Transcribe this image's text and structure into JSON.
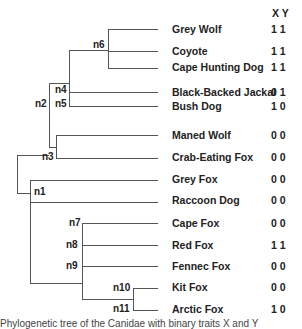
{
  "header": {
    "xy_label": "X Y"
  },
  "leaves": [
    {
      "name": "Grey Wolf",
      "xy": "1 1",
      "y": 23
    },
    {
      "name": "Coyote",
      "xy": "1 1",
      "y": 45
    },
    {
      "name": "Cape Hunting Dog",
      "xy": "1 1",
      "y": 61
    },
    {
      "name": "Black-Backed Jackal",
      "xy": "0 1",
      "y": 86
    },
    {
      "name": "Bush Dog",
      "xy": "1 0",
      "y": 100
    },
    {
      "name": "Maned Wolf",
      "xy": "0 0",
      "y": 129
    },
    {
      "name": "Crab-Eating Fox",
      "xy": "0 0",
      "y": 151
    },
    {
      "name": "Grey Fox",
      "xy": "0 0",
      "y": 173
    },
    {
      "name": "Raccoon Dog",
      "xy": "0 0",
      "y": 194
    },
    {
      "name": "Cape Fox",
      "xy": "0 0",
      "y": 217
    },
    {
      "name": "Red Fox",
      "xy": "1 1",
      "y": 239
    },
    {
      "name": "Fennec Fox",
      "xy": "0 0",
      "y": 260
    },
    {
      "name": "Kit Fox",
      "xy": "0 0",
      "y": 281
    },
    {
      "name": "Arctic Fox",
      "xy": "1 0",
      "y": 303
    }
  ],
  "nodes": [
    {
      "id": "n6",
      "x": 93,
      "y": 39
    },
    {
      "id": "n4",
      "x": 55,
      "y": 84
    },
    {
      "id": "n5",
      "x": 55,
      "y": 98
    },
    {
      "id": "n2",
      "x": 35,
      "y": 98
    },
    {
      "id": "n3",
      "x": 42,
      "y": 151
    },
    {
      "id": "n1",
      "x": 34,
      "y": 186
    },
    {
      "id": "n7",
      "x": 69,
      "y": 217
    },
    {
      "id": "n8",
      "x": 66,
      "y": 239
    },
    {
      "id": "n9",
      "x": 66,
      "y": 260
    },
    {
      "id": "n10",
      "x": 113,
      "y": 282
    },
    {
      "id": "n11",
      "x": 113,
      "y": 303
    }
  ],
  "caption": "Phylogenetic tree of the Canidae with binary traits X and Y"
}
